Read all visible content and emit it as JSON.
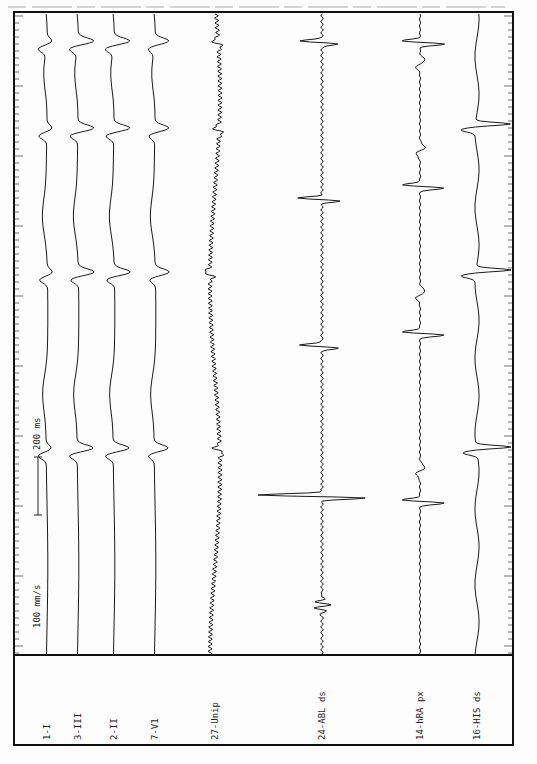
{
  "recording": {
    "paper_speed_label": "100 mm/s",
    "scale_bar_label": "200 ms",
    "colors": {
      "trace": "#1a1a1a",
      "frame": "#111111",
      "paper": "#fdfdfd"
    }
  },
  "channels": [
    {
      "id": "1-I",
      "label": "1-I",
      "x": 47
    },
    {
      "id": "3-III",
      "label": "3-III",
      "x": 78
    },
    {
      "id": "2-II",
      "label": "2-II",
      "x": 114
    },
    {
      "id": "7-V1",
      "label": "7-V1",
      "x": 155
    },
    {
      "id": "27-Unip",
      "label": "27-Unip",
      "x": 215
    },
    {
      "id": "24-ABL ds",
      "label": "24-ABL ds",
      "x": 322
    },
    {
      "id": "14-hRA px",
      "label": "14-hRA px",
      "x": 420
    },
    {
      "id": "16-HIS ds",
      "label": "16-HIS ds",
      "x": 477
    }
  ],
  "beats_y": [
    41,
    128,
    272,
    448
  ],
  "ablation_spikes_y": [
    495,
    345,
    198,
    41
  ],
  "hra_spikes_y": [
    500,
    332,
    185,
    41
  ],
  "his_spikes_y": [
    447,
    270,
    124
  ]
}
